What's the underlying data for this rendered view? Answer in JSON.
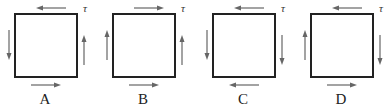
{
  "diagram": {
    "stress_symbol": "τ",
    "panels": [
      {
        "label": "A",
        "top": "left",
        "left": "down",
        "right": "up",
        "bottom": "right"
      },
      {
        "label": "B",
        "top": "right",
        "left": "up",
        "right": "up",
        "bottom": "right"
      },
      {
        "label": "C",
        "top": "left",
        "left": "down",
        "right": "down",
        "bottom": "left"
      },
      {
        "label": "D",
        "top": "left",
        "left": "up",
        "right": "down",
        "bottom": "right"
      }
    ],
    "colors": {
      "border": "#222222",
      "arrow": "#666666"
    }
  }
}
